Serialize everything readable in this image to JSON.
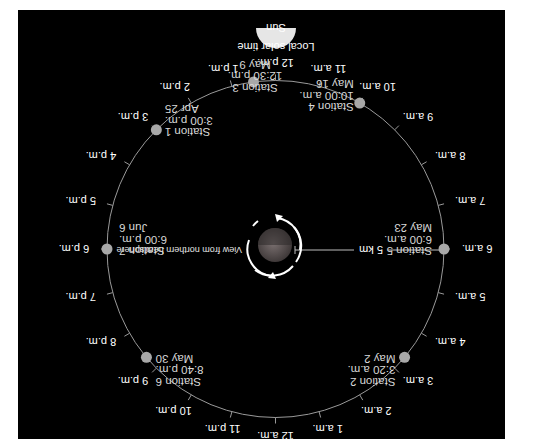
{
  "diagram": {
    "orientation": "rotated-180",
    "colors": {
      "background": "#000000",
      "page": "#ffffff",
      "orbit": "#9a9a9a",
      "station_dot": "#a8a8a8",
      "sun": "#e6e6e6",
      "text": "#ffffff",
      "planet_light": "#6e6e6e",
      "planet_dark": "#3a3a3a",
      "arrow": "#ffffff"
    },
    "sun": {
      "label": "Sun",
      "caption": "Local solar time"
    },
    "planet": {
      "rotation_caption": "View from northern hemisphere",
      "radius_label": "5 km"
    },
    "hour_labels": [
      {
        "hour": 0,
        "label": "12 a.m."
      },
      {
        "hour": 1,
        "label": "1 a.m."
      },
      {
        "hour": 2,
        "label": "2 a.m."
      },
      {
        "hour": 3,
        "label": "3 a.m."
      },
      {
        "hour": 4,
        "label": "4 a.m."
      },
      {
        "hour": 5,
        "label": "5 a.m."
      },
      {
        "hour": 6,
        "label": "6 a.m."
      },
      {
        "hour": 7,
        "label": "7 a.m."
      },
      {
        "hour": 8,
        "label": "8 a.m."
      },
      {
        "hour": 9,
        "label": "9 a.m."
      },
      {
        "hour": 10,
        "label": "10 a.m."
      },
      {
        "hour": 11,
        "label": "11 a.m."
      },
      {
        "hour": 12,
        "label": "12 p.m."
      },
      {
        "hour": 13,
        "label": "1 p.m."
      },
      {
        "hour": 14,
        "label": "2 p.m."
      },
      {
        "hour": 15,
        "label": "3 p.m."
      },
      {
        "hour": 16,
        "label": "4 p.m."
      },
      {
        "hour": 17,
        "label": "5 p.m."
      },
      {
        "hour": 18,
        "label": "6 p.m."
      },
      {
        "hour": 19,
        "label": "7 p.m."
      },
      {
        "hour": 20,
        "label": "8 p.m."
      },
      {
        "hour": 21,
        "label": "9 p.m."
      },
      {
        "hour": 22,
        "label": "10 p.m."
      },
      {
        "hour": 23,
        "label": "11 p.m."
      }
    ],
    "stations": [
      {
        "name": "Station 1",
        "time": "3:00 p.m.",
        "date": "Apr 25",
        "hour": 15.0
      },
      {
        "name": "Station 2",
        "time": "3:20 a.m.",
        "date": "May 2",
        "hour": 3.333
      },
      {
        "name": "Station 3",
        "time": "12:30 p.m.",
        "date": "May 9",
        "hour": 12.5
      },
      {
        "name": "Station 4",
        "time": "10:00 a.m.",
        "date": "May 16",
        "hour": 10.0
      },
      {
        "name": "Station 5",
        "time": "6:00 a.m.",
        "date": "May 23",
        "hour": 6.0
      },
      {
        "name": "Station 6",
        "time": "8:40 p.m.",
        "date": "May 30",
        "hour": 20.667
      },
      {
        "name": "Station 7",
        "time": "6:00 p.m.",
        "date": "Jun 6",
        "hour": 18.0
      }
    ]
  }
}
